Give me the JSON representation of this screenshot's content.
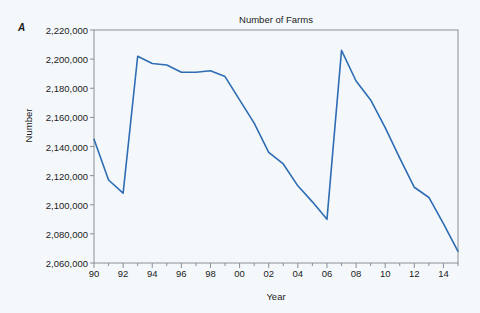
{
  "figure": {
    "panel_letter": "A",
    "background_color": "#f5f8fb",
    "frame_color": "#8a8f96",
    "text_color": "#1b1b1b"
  },
  "chart_data": {
    "type": "line",
    "title": "Number of Farms",
    "xlabel": "Year",
    "ylabel": "Number",
    "grid": false,
    "legend": null,
    "line_color": "#2e6db4",
    "line_width": 1.6,
    "xlim": [
      1990,
      2015
    ],
    "ylim": [
      2060000,
      2220000
    ],
    "ytick_step": 20000,
    "ytick_values": [
      2060000,
      2080000,
      2100000,
      2120000,
      2140000,
      2160000,
      2180000,
      2200000,
      2220000
    ],
    "ytick_labels": [
      "2,060,000",
      "2,080,000",
      "2,100,000",
      "2,120,000",
      "2,140,000",
      "2,160,000",
      "2,180,000",
      "2,200,000",
      "2,220,000"
    ],
    "xtick_values": [
      1990,
      1992,
      1994,
      1996,
      1998,
      2000,
      2002,
      2004,
      2006,
      2008,
      2010,
      2012,
      2014
    ],
    "xtick_labels": [
      "90",
      "92",
      "94",
      "96",
      "98",
      "00",
      "02",
      "04",
      "06",
      "08",
      "10",
      "12",
      "14"
    ],
    "xtick_minor_values": [
      1991,
      1993,
      1995,
      1997,
      1999,
      2001,
      2003,
      2005,
      2007,
      2009,
      2011,
      2013,
      2015
    ],
    "series": [
      {
        "name": "Number of Farms",
        "x": [
          1990,
          1991,
          1992,
          1993,
          1994,
          1995,
          1996,
          1997,
          1998,
          1999,
          2000,
          2001,
          2002,
          2003,
          2004,
          2005,
          2006,
          2007,
          2008,
          2009,
          2010,
          2011,
          2012,
          2013,
          2014,
          2015
        ],
        "values": [
          2145000,
          2117000,
          2108000,
          2202000,
          2197000,
          2196000,
          2191000,
          2191000,
          2192000,
          2188000,
          2172000,
          2156000,
          2136000,
          2128000,
          2113000,
          2102000,
          2090000,
          2206000,
          2185000,
          2172000,
          2153000,
          2132000,
          2112000,
          2105000,
          2087000,
          2068000
        ]
      }
    ]
  }
}
